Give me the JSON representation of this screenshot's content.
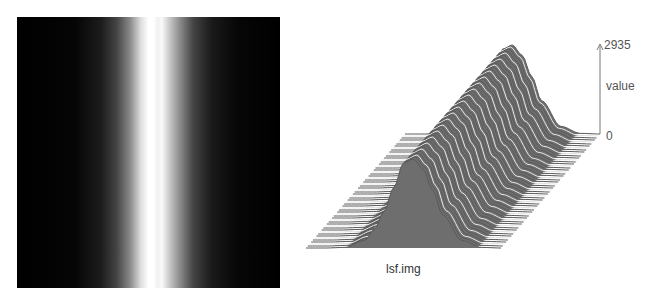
{
  "left_image": {
    "description": "grayscale intensity image with vertical bright band",
    "background_color": "#000000",
    "peak_color": "#ffffff",
    "band_center_fraction": 0.505,
    "band_sigma_fraction": 0.11
  },
  "surface_plot": {
    "caption": "lsf.img",
    "axis": {
      "max_label": "2935",
      "name_label": "value",
      "zero_label": "0"
    },
    "line_color": "#5a5a5a",
    "highlight_color": "#e8e8e8"
  },
  "chart_data": {
    "type": "surface",
    "title": "lsf.img",
    "zlabel": "value",
    "zlim": [
      0,
      2935
    ],
    "profile": {
      "description": "Line spread function: Gaussian-like profile across x, constant along y",
      "x_fraction": [
        0.0,
        0.1,
        0.2,
        0.3,
        0.35,
        0.4,
        0.45,
        0.5,
        0.55,
        0.6,
        0.65,
        0.7,
        0.8,
        0.9,
        1.0
      ],
      "values": [
        0,
        0,
        20,
        250,
        600,
        1200,
        2000,
        2800,
        2935,
        2600,
        1900,
        1100,
        250,
        20,
        0
      ]
    },
    "grid": false,
    "legend": null
  }
}
